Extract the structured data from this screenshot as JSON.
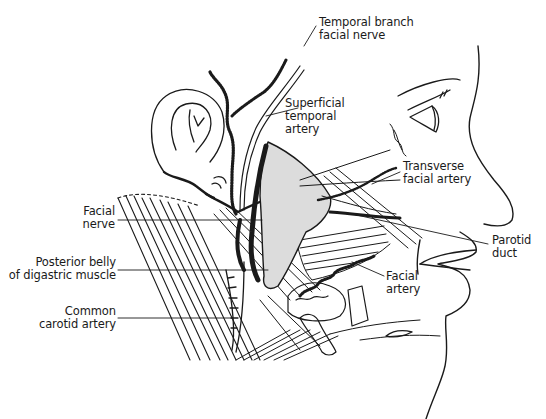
{
  "figure": {
    "colors": {
      "ink": "#1a1a1a",
      "background": "#ffffff",
      "gland": "#d9d9d9"
    }
  },
  "labels": [
    {
      "id": "temporal_branch",
      "text": "Temporal branch\nfacial nerve",
      "x": 319,
      "y": 16,
      "align": "left"
    },
    {
      "id": "superficial_temporal",
      "text": "Superficial\ntemporal\nartery",
      "x": 285,
      "y": 97,
      "align": "left"
    },
    {
      "id": "transverse_facial",
      "text": "Transverse\nfacial artery",
      "x": 403,
      "y": 160,
      "align": "left"
    },
    {
      "id": "facial_nerve",
      "text": "Facial\nnerve",
      "x": 60,
      "y": 205,
      "align": "right",
      "width": 55
    },
    {
      "id": "posterior_belly",
      "text": "Posterior belly\nof digastric muscle",
      "x": 8,
      "y": 256,
      "align": "right",
      "width": 108
    },
    {
      "id": "common_carotid",
      "text": "Common\ncarotid artery",
      "x": 20,
      "y": 305,
      "align": "right",
      "width": 96
    },
    {
      "id": "parotid_duct",
      "text": "Parotid\nduct",
      "x": 492,
      "y": 234,
      "align": "left"
    },
    {
      "id": "facial_artery",
      "text": "Facial\nartery",
      "x": 386,
      "y": 270,
      "align": "left"
    }
  ]
}
